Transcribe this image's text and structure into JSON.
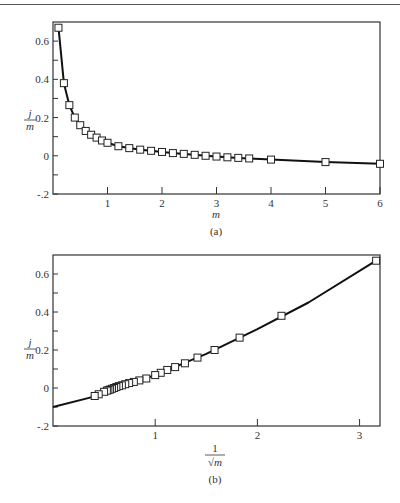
{
  "chart_data": [
    {
      "id": "a",
      "type": "line",
      "caption": "(a)",
      "xlabel": "m",
      "ylabel": "j/m",
      "ylabel_num": "j",
      "ylabel_den": "m",
      "xlim": [
        0,
        6
      ],
      "ylim": [
        -0.2,
        0.7
      ],
      "xticks": [
        1,
        2,
        3,
        4,
        5,
        6
      ],
      "xtick_labels": [
        "1",
        "2",
        "3",
        "4",
        "5",
        "6"
      ],
      "yticks": [
        -0.2,
        -0.1,
        0,
        0.1,
        0.2,
        0.3,
        0.4,
        0.5,
        0.6
      ],
      "ytick_labels": {
        "-0.2": "-.2",
        "0": "0",
        "0.2": "0.2",
        "0.4": "0.4",
        "0.6": "0.6"
      },
      "grid": false,
      "marker": "square",
      "series": [
        {
          "name": "j/m vs m",
          "x": [
            0.1,
            0.2,
            0.3,
            0.4,
            0.5,
            0.6,
            0.7,
            0.8,
            0.9,
            1.0,
            1.2,
            1.4,
            1.6,
            1.8,
            2.0,
            2.2,
            2.4,
            2.6,
            2.8,
            3.0,
            3.2,
            3.4,
            3.6,
            4.0,
            5.0,
            6.0
          ],
          "y": [
            0.67,
            0.38,
            0.265,
            0.2,
            0.16,
            0.13,
            0.11,
            0.095,
            0.08,
            0.068,
            0.05,
            0.04,
            0.032,
            0.026,
            0.02,
            0.014,
            0.01,
            0.005,
            0.0,
            -0.004,
            -0.008,
            -0.011,
            -0.014,
            -0.02,
            -0.033,
            -0.042
          ]
        }
      ]
    },
    {
      "id": "b",
      "type": "line",
      "caption": "(b)",
      "xlabel": "1/√m",
      "xlabel_num": "1",
      "xlabel_den": "√m",
      "ylabel": "j/m",
      "ylabel_num": "j",
      "ylabel_den": "m",
      "xlim": [
        0,
        3.2
      ],
      "ylim": [
        -0.2,
        0.7
      ],
      "xticks": [
        1,
        2,
        3
      ],
      "xtick_labels": [
        "1",
        "2",
        "3"
      ],
      "yticks": [
        -0.2,
        -0.1,
        0,
        0.1,
        0.2,
        0.3,
        0.4,
        0.5,
        0.6
      ],
      "ytick_labels": {
        "-0.2": "-.2",
        "0": "0",
        "0.2": "0.2",
        "0.4": "0.4",
        "0.6": "0.6"
      },
      "grid": false,
      "marker": "square",
      "series": [
        {
          "name": "j/m vs 1/sqrt(m)",
          "x": [
            3.162,
            2.236,
            1.826,
            1.581,
            1.414,
            1.291,
            1.195,
            1.118,
            1.054,
            1.0,
            0.913,
            0.845,
            0.791,
            0.745,
            0.707,
            0.674,
            0.645,
            0.62,
            0.598,
            0.577,
            0.559,
            0.542,
            0.527,
            0.5,
            0.447,
            0.408
          ],
          "y": [
            0.67,
            0.38,
            0.265,
            0.2,
            0.16,
            0.13,
            0.11,
            0.095,
            0.08,
            0.068,
            0.05,
            0.04,
            0.032,
            0.026,
            0.02,
            0.014,
            0.01,
            0.005,
            0.0,
            -0.004,
            -0.008,
            -0.011,
            -0.014,
            -0.02,
            -0.033,
            -0.042
          ]
        }
      ],
      "fit_line": {
        "x": [
          0.0,
          0.4,
          1.0,
          1.5,
          2.0,
          2.5,
          3.162
        ],
        "y": [
          -0.1,
          -0.045,
          0.068,
          0.18,
          0.31,
          0.45,
          0.67
        ]
      }
    }
  ]
}
